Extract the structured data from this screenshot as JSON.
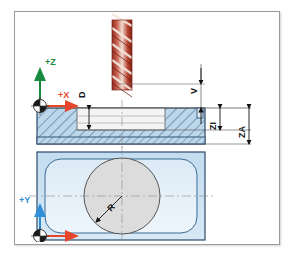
{
  "diagram": {
    "views": {
      "section": "front-section-view",
      "plan": "top-plan-view"
    },
    "tool": {
      "name": "end-mill-cutter",
      "color": "#b03a2e",
      "flute_color": "#f2e2d8"
    },
    "workpiece": {
      "fill": "#bcd6ea",
      "hatch_color": "#3b5f86",
      "outline": "#2b4a6b",
      "pocket_fill": "#f2f2f2",
      "plan_fill": "#cfe3f2",
      "plan_inner_fill": "#e4f0fa",
      "circle_fill": "#dcdcdc"
    },
    "axes": [
      {
        "id": "z-axis-section",
        "label": "+Z",
        "color": "#188a3c",
        "view": "section"
      },
      {
        "id": "x-axis-section",
        "label": "+X",
        "color": "#e8462a",
        "view": "section"
      },
      {
        "id": "y-axis-plan",
        "label": "+Y",
        "color": "#2f8fd8",
        "view": "plan"
      },
      {
        "id": "x-axis-plan",
        "label": "+X",
        "color": "#e8462a",
        "view": "plan"
      }
    ],
    "dimensions": [
      {
        "id": "dimension-d",
        "label": "D",
        "view": "section",
        "orientation": "vertical-rotated"
      },
      {
        "id": "dimension-v",
        "label": "V",
        "view": "section",
        "orientation": "vertical-rotated"
      },
      {
        "id": "dimension-zi",
        "label": "ZI",
        "view": "section",
        "orientation": "vertical-rotated"
      },
      {
        "id": "dimension-za",
        "label": "ZA",
        "view": "section",
        "orientation": "vertical-rotated"
      },
      {
        "id": "dimension-r",
        "label": "R",
        "view": "plan",
        "orientation": "radial"
      }
    ],
    "origin_symbol": {
      "name": "workpiece-zero-symbol",
      "description": "quadrant-filled circle datum marker"
    }
  }
}
